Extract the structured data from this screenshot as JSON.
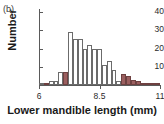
{
  "panel": {
    "label": "(b)"
  },
  "chart_data": {
    "type": "bar",
    "title": "",
    "subtitle": "",
    "xlabel": "Lower mandible length (mm)",
    "ylabel": "Number",
    "xlim": [
      6.0,
      11.0
    ],
    "ylim": [
      0,
      40
    ],
    "grid": false,
    "legend_position": "none",
    "y_ticks": [
      10,
      20,
      30,
      40
    ],
    "y_tick_labels": [
      "10",
      "20",
      "30",
      "40"
    ],
    "x_ticks": [
      6,
      8.5,
      11
    ],
    "x_tick_labels": [
      "6",
      "8.5",
      "11"
    ],
    "bin_width": 0.2,
    "categories": [
      "6.0",
      "6.2",
      "6.4",
      "6.6",
      "6.8",
      "7.0",
      "7.2",
      "7.4",
      "7.6",
      "7.8",
      "8.0",
      "8.2",
      "8.4",
      "8.6",
      "8.8",
      "9.0",
      "9.2",
      "9.4",
      "9.6",
      "9.8",
      "10.0",
      "10.2",
      "10.4",
      "10.6",
      "10.8"
    ],
    "values": [
      1,
      1,
      2,
      2,
      7,
      7,
      29,
      25,
      25,
      20,
      22,
      20,
      20,
      11,
      13,
      8,
      2,
      6,
      5,
      3,
      2,
      1,
      1,
      1,
      1
    ],
    "bar_styles": [
      "open",
      "filled",
      "open",
      "open",
      "open",
      "filled",
      "open",
      "open",
      "open",
      "open",
      "open",
      "open",
      "open",
      "open",
      "open",
      "open",
      "open",
      "filled",
      "filled",
      "filled",
      "filled",
      "filled",
      "filled",
      "filled",
      "filled"
    ],
    "series": [
      {
        "name": "unfilled",
        "fill": "#ffffff",
        "values": [
          1,
          null,
          2,
          2,
          7,
          null,
          29,
          25,
          25,
          20,
          22,
          20,
          20,
          11,
          13,
          8,
          2,
          null,
          null,
          null,
          null,
          null,
          null,
          null,
          null
        ]
      },
      {
        "name": "filled",
        "fill": "#9b5f5f",
        "values": [
          null,
          1,
          null,
          null,
          null,
          7,
          null,
          null,
          null,
          null,
          null,
          null,
          null,
          null,
          null,
          null,
          null,
          6,
          5,
          3,
          2,
          1,
          1,
          1,
          1
        ]
      }
    ],
    "colors": {
      "fill_highlight": "#9b5f5f",
      "fill_open": "#ffffff",
      "outline": "#6b6b6b",
      "axis": "#5a5a5a",
      "text": "#1a1a1a"
    }
  }
}
